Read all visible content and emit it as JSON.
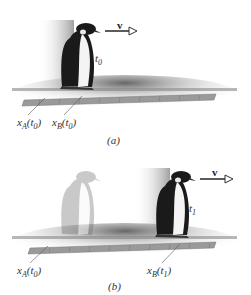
{
  "panel_a": {
    "velocity_label": "v",
    "time_label": "t",
    "time_sub": "0",
    "marker_a": {
      "var": "x",
      "sub": "A",
      "arg": "t",
      "arg_sub": "0"
    },
    "marker_b": {
      "var": "x",
      "sub": "B",
      "arg": "t",
      "arg_sub": "0"
    },
    "caption": "(a)"
  },
  "panel_b": {
    "velocity_label": "v",
    "time_label": "t",
    "time_sub": "1",
    "marker_a": {
      "var": "x",
      "sub": "A",
      "arg": "t",
      "arg_sub": "0"
    },
    "marker_b": {
      "var": "x",
      "sub": "B",
      "arg": "t",
      "arg_sub": "1"
    },
    "caption": "(b)"
  },
  "colors": {
    "ruler": "#9a9a9a",
    "ground_shadow": "#777777",
    "penguin_dark": "#1a1a1a",
    "ghost": "#bdbdbd",
    "arrow": "#333333"
  }
}
